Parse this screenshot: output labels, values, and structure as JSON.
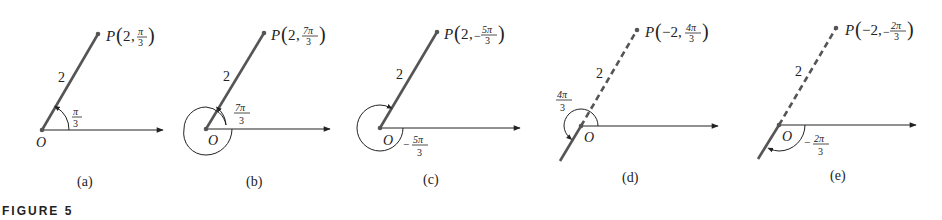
{
  "figure": {
    "caption": "FIGURE 5",
    "panels": [
      {
        "id": "a",
        "caption": "(a)",
        "point_label": "P",
        "r": "2",
        "theta_num": "π",
        "theta_den": "3",
        "theta_sign": "",
        "segment_label": "2",
        "angle_label_num": "π",
        "angle_label_den": "3",
        "angle_label_sign": "",
        "origin_label": "O",
        "line_style": "solid",
        "angle_direction": "counterclockwise"
      },
      {
        "id": "b",
        "caption": "(b)",
        "point_label": "P",
        "r": "2",
        "theta_num": "7π",
        "theta_den": "3",
        "theta_sign": "",
        "segment_label": "2",
        "angle_label_num": "7π",
        "angle_label_den": "3",
        "angle_label_sign": "",
        "origin_label": "O",
        "line_style": "solid",
        "angle_direction": "counterclockwise, full turn plus π/3"
      },
      {
        "id": "c",
        "caption": "(c)",
        "point_label": "P",
        "r": "2",
        "theta_num": "5π",
        "theta_den": "3",
        "theta_sign": "−",
        "segment_label": "2",
        "angle_label_num": "5π",
        "angle_label_den": "3",
        "angle_label_sign": "−",
        "origin_label": "O",
        "line_style": "solid",
        "angle_direction": "clockwise"
      },
      {
        "id": "d",
        "caption": "(d)",
        "point_label": "P",
        "r": "−2",
        "theta_num": "4π",
        "theta_den": "3",
        "theta_sign": "",
        "segment_label": "2",
        "angle_label_num": "4π",
        "angle_label_den": "3",
        "angle_label_sign": "",
        "origin_label": "O",
        "line_style": "dashed",
        "angle_direction": "counterclockwise"
      },
      {
        "id": "e",
        "caption": "(e)",
        "point_label": "P",
        "r": "−2",
        "theta_num": "2π",
        "theta_den": "3",
        "theta_sign": "−",
        "segment_label": "2",
        "angle_label_num": "2π",
        "angle_label_den": "3",
        "angle_label_sign": "−",
        "origin_label": "O",
        "line_style": "dashed",
        "angle_direction": "clockwise"
      }
    ],
    "colors": {
      "segment": "#555555",
      "axis": "#222222",
      "text": "#222222"
    }
  }
}
